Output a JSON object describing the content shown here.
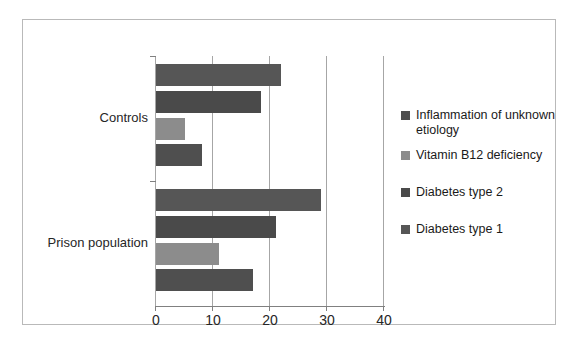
{
  "chart_data": {
    "type": "bar",
    "orientation": "horizontal",
    "title": "",
    "xlabel": "",
    "ylabel": "",
    "categories": [
      "Controls",
      "Prison population"
    ],
    "xlim": [
      0,
      40
    ],
    "xticks": [
      0,
      10,
      20,
      30,
      40
    ],
    "xticklabels": [
      "0",
      "10",
      "20",
      "30",
      "40"
    ],
    "grid": true,
    "legend_position": "right",
    "series": [
      {
        "name": "Inflammation of unknown etiology",
        "color": "#4f4f4f",
        "values": [
          8,
          17
        ]
      },
      {
        "name": "Vitamin B12 deficiency",
        "color": "#8c8c8c",
        "values": [
          5,
          11
        ]
      },
      {
        "name": "Diabetes type 2",
        "color": "#4a4a4a",
        "values": [
          18.5,
          21
        ]
      },
      {
        "name": "Diabetes type 1",
        "color": "#565656",
        "values": [
          22,
          29
        ]
      }
    ]
  },
  "legend": {
    "items": [
      {
        "label": "Inflammation of unknown etiology",
        "color": "#4f4f4f"
      },
      {
        "label": "Vitamin B12 deficiency",
        "color": "#8c8c8c"
      },
      {
        "label": "Diabetes type 2",
        "color": "#4a4a4a"
      },
      {
        "label": "Diabetes type 1",
        "color": "#565656"
      }
    ]
  },
  "axis": {
    "tick_labels": [
      "0",
      "10",
      "20",
      "30",
      "40"
    ],
    "category_labels": [
      "Controls",
      "Prison population"
    ]
  },
  "colors": {
    "frame": "#b9b9b9",
    "gridline": "#a6a6a6",
    "axis": "#808080",
    "text": "#262626",
    "background": "#ffffff"
  }
}
